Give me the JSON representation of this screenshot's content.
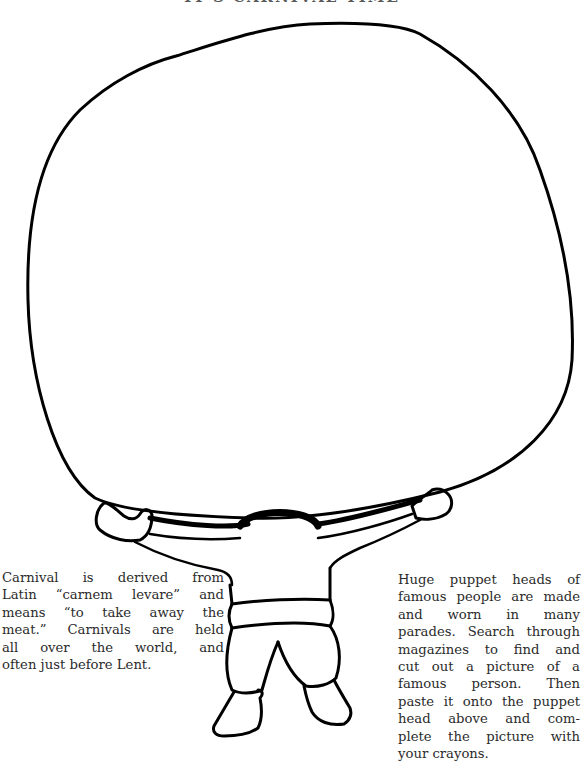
{
  "page": {
    "title_partial": "IT'S CARNIVAL TIME",
    "colors": {
      "ink": "#000000",
      "text": "#2b2b2b",
      "background": "#ffffff"
    }
  },
  "illustration": {
    "subject": "puppet-carrier figure holding a huge blank puppet head",
    "head_area": "blank oval for pasting a picture"
  },
  "left_text": {
    "lines": [
      "Carnival is derived from",
      "Latin “carnem levare” and",
      "means “to take away the",
      "meat.” Carnivals are held",
      "all over the world, and",
      "often just before Lent."
    ]
  },
  "right_text": {
    "lines": [
      "Huge puppet heads of",
      "famous people are made",
      "and worn in many",
      "parades. Search through",
      "magazines to find and",
      "cut out a picture of a",
      "famous person. Then",
      "paste it onto the puppet",
      "head above and com-",
      "plete the picture with",
      "your crayons."
    ]
  }
}
